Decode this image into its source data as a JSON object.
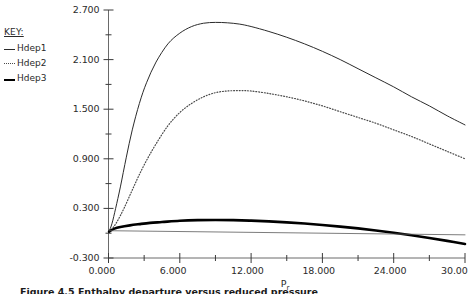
{
  "figure": {
    "caption": "Figure 4.5 Enthalpy departure versus reduced pressure",
    "background": "#ffffff"
  },
  "legend": {
    "title": "KEY:",
    "items": [
      {
        "label": "Hdep1",
        "style": "solid-thin",
        "color": "#2b2b2b"
      },
      {
        "label": "Hdep2",
        "style": "dotted",
        "color": "#4a4a4a"
      },
      {
        "label": "Hdep3",
        "style": "solid-thick",
        "color": "#000000"
      }
    ]
  },
  "chart_data": {
    "type": "line",
    "title": "",
    "xlabel": "Pr",
    "ylabel": "",
    "xlim": [
      0.0,
      30.0
    ],
    "ylim": [
      -0.3,
      2.7
    ],
    "grid": false,
    "legend_position": "upper-left-outside",
    "x_ticks": [
      0.0,
      6.0,
      12.0,
      18.0,
      24.0,
      30.0
    ],
    "x_tick_labels": [
      "0.000",
      "6.000",
      "12.000",
      "18.000",
      "24.000",
      "30.00"
    ],
    "x_minor_ticks": [
      3.0,
      9.0,
      15.0,
      21.0,
      27.0
    ],
    "y_ticks": [
      -0.3,
      0.3,
      0.9,
      1.5,
      2.1,
      2.7
    ],
    "y_tick_labels": [
      "-0.300",
      "0.300",
      "0.900",
      "1.500",
      "2.100",
      "2.700"
    ],
    "y_minor_ticks": [
      0.0,
      0.6,
      1.2,
      1.8,
      2.4
    ],
    "series": [
      {
        "name": "Hdep1",
        "style": "solid-thin",
        "color": "#2b2b2b",
        "width": 1.0,
        "x": [
          0.05,
          0.3,
          0.6,
          1.0,
          1.5,
          2.0,
          2.6,
          3.2,
          4.0,
          5.0,
          6.0,
          7.0,
          8.0,
          9.0,
          10.0,
          11.0,
          12.0,
          13.5,
          15.0,
          16.5,
          18.0,
          19.5,
          21.0,
          22.5,
          24.0,
          25.5,
          27.0,
          28.5,
          30.0
        ],
        "y": [
          0.02,
          0.12,
          0.3,
          0.56,
          0.92,
          1.25,
          1.57,
          1.82,
          2.07,
          2.29,
          2.42,
          2.5,
          2.54,
          2.55,
          2.545,
          2.53,
          2.5,
          2.44,
          2.37,
          2.29,
          2.2,
          2.1,
          1.99,
          1.88,
          1.77,
          1.65,
          1.54,
          1.42,
          1.31
        ]
      },
      {
        "name": "Hdep2",
        "style": "dotted",
        "color": "#4a4a4a",
        "width": 1.2,
        "x": [
          0.05,
          0.4,
          0.8,
          1.3,
          1.9,
          2.5,
          3.2,
          4.0,
          5.0,
          6.0,
          7.0,
          8.0,
          9.0,
          10.0,
          11.0,
          12.0,
          13.5,
          15.0,
          16.5,
          18.0,
          19.5,
          21.0,
          22.5,
          24.0,
          25.5,
          27.0,
          28.5,
          30.0
        ],
        "y": [
          0.02,
          0.07,
          0.16,
          0.3,
          0.49,
          0.68,
          0.88,
          1.08,
          1.3,
          1.46,
          1.57,
          1.65,
          1.7,
          1.72,
          1.725,
          1.72,
          1.69,
          1.65,
          1.6,
          1.54,
          1.47,
          1.4,
          1.33,
          1.25,
          1.17,
          1.08,
          0.99,
          0.9
        ]
      },
      {
        "name": "Hdep3",
        "style": "solid-thick",
        "color": "#000000",
        "width": 2.6,
        "x": [
          0.05,
          0.5,
          1.0,
          1.8,
          2.6,
          3.5,
          4.5,
          6.0,
          7.5,
          9.0,
          10.5,
          12.0,
          13.5,
          15.0,
          16.5,
          18.0,
          19.5,
          21.0,
          22.5,
          24.0,
          25.5,
          27.0,
          28.5,
          30.0
        ],
        "y": [
          0.02,
          0.055,
          0.075,
          0.095,
          0.11,
          0.125,
          0.135,
          0.15,
          0.158,
          0.16,
          0.158,
          0.152,
          0.143,
          0.131,
          0.117,
          0.1,
          0.08,
          0.058,
          0.033,
          0.005,
          -0.025,
          -0.058,
          -0.093,
          -0.13
        ]
      },
      {
        "name": "reference-line",
        "style": "solid-thin",
        "color": "#5a5a5a",
        "width": 0.8,
        "x": [
          0.05,
          30.0
        ],
        "y": [
          0.03,
          -0.02
        ]
      }
    ]
  }
}
